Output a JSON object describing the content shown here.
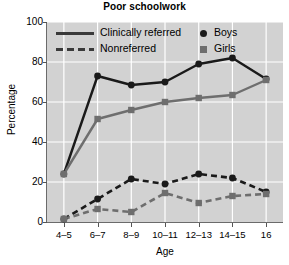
{
  "chart_data": {
    "type": "line",
    "title": "Poor schoolwork",
    "xlabel": "Age",
    "ylabel": "Percentage",
    "categories": [
      "4–5",
      "6–7",
      "8–9",
      "10–11",
      "12–13",
      "14–15",
      "16"
    ],
    "ylim": [
      0,
      100
    ],
    "yticks": [
      0,
      20,
      40,
      60,
      80,
      100
    ],
    "ytick_labels": [
      "0",
      "20",
      "40",
      "60",
      "80",
      "100"
    ],
    "grid": true,
    "legend_position": "top-left",
    "plot_background": "#d2d2d2",
    "series": [
      {
        "name": "Clinically referred — Boys",
        "group": "Clinically referred",
        "marker": "circle",
        "line_style": "solid",
        "color": "#1a1a1a",
        "values": [
          24,
          73,
          68.5,
          70,
          79,
          82,
          71.5
        ]
      },
      {
        "name": "Clinically referred — Girls",
        "group": "Clinically referred",
        "marker": "square",
        "line_style": "solid",
        "color": "#6e6e6e",
        "values": [
          24,
          51.5,
          56,
          60,
          62,
          63.5,
          71
        ]
      },
      {
        "name": "Nonreferred — Boys",
        "group": "Nonreferred",
        "marker": "circle",
        "line_style": "dashed",
        "color": "#1a1a1a",
        "values": [
          1.5,
          11.5,
          21.5,
          19,
          24,
          22,
          15
        ]
      },
      {
        "name": "Nonreferred — Girls",
        "group": "Nonreferred",
        "marker": "square",
        "line_style": "dashed",
        "color": "#6e6e6e",
        "values": [
          1.5,
          6.5,
          5,
          14.5,
          9.5,
          13,
          14
        ]
      }
    ]
  },
  "legend": {
    "line_entries": [
      {
        "label": "Clinically referred",
        "style": "solid"
      },
      {
        "label": "Nonreferred",
        "style": "dashed"
      }
    ],
    "marker_entries": [
      {
        "label": "Boys",
        "marker": "circle",
        "color": "#1a1a1a"
      },
      {
        "label": "Girls",
        "marker": "square",
        "color": "#6e6e6e"
      }
    ]
  }
}
